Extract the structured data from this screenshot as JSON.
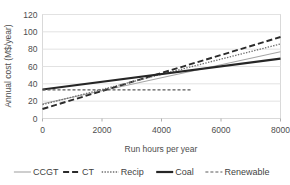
{
  "chart_data": {
    "type": "line",
    "title": "",
    "xlabel": "Run hours per year",
    "ylabel": "Annual cost (M$/year)",
    "xlim": [
      0,
      8000
    ],
    "ylim": [
      0,
      120
    ],
    "xticks": [
      0,
      2000,
      4000,
      6000,
      8000
    ],
    "yticks": [
      0,
      20,
      40,
      60,
      80,
      100,
      120
    ],
    "grid": true,
    "legend_position": "bottom",
    "series": [
      {
        "name": "CCGT",
        "style": "solid-thin",
        "color": "#a6a6a6",
        "x": [
          0,
          8000
        ],
        "values": [
          17,
          77
        ]
      },
      {
        "name": "CT",
        "style": "dashed",
        "color": "#2b2b2b",
        "x": [
          0,
          8000
        ],
        "values": [
          11,
          94
        ]
      },
      {
        "name": "Recip",
        "style": "dotted",
        "color": "#6e6e6e",
        "x": [
          0,
          8000
        ],
        "values": [
          16,
          86
        ]
      },
      {
        "name": "Coal",
        "style": "solid-thick",
        "color": "#262626",
        "x": [
          0,
          8000
        ],
        "values": [
          33.5,
          69
        ]
      },
      {
        "name": "Renewable",
        "style": "short-dash",
        "color": "#5a5a5a",
        "x": [
          0,
          5000
        ],
        "values": [
          33,
          33
        ]
      }
    ]
  },
  "legend": {
    "items": [
      {
        "label": "CCGT"
      },
      {
        "label": "CT"
      },
      {
        "label": "Recip"
      },
      {
        "label": "Coal"
      },
      {
        "label": "Renewable"
      }
    ]
  },
  "axes": {
    "x_tick_labels": [
      "0",
      "2000",
      "4000",
      "6000",
      "8000"
    ],
    "y_tick_labels": [
      "0",
      "20",
      "40",
      "60",
      "80",
      "100",
      "120"
    ],
    "x_title": "Run hours per year",
    "y_title": "Annual cost (M$/year)"
  }
}
